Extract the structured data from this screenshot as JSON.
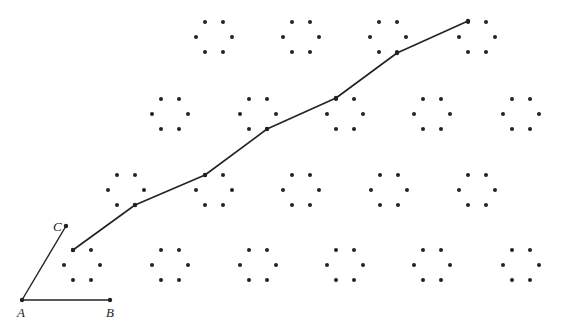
{
  "diagram": {
    "colors": {
      "ink": "#222222",
      "background": "#ffffff"
    },
    "labels": {
      "A": "A",
      "B": "B",
      "C": "C"
    },
    "cluster_rows": [
      {
        "row": 1,
        "clusters": 4
      },
      {
        "row": 2,
        "clusters": 5
      },
      {
        "row": 3,
        "clusters": 5
      },
      {
        "row": 4,
        "clusters": 6
      }
    ],
    "dots_per_cluster": 6,
    "path_vertex_count": 7
  }
}
